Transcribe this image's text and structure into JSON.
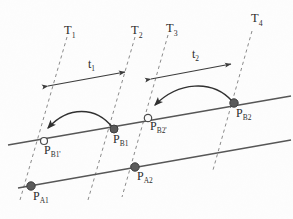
{
  "figure": {
    "background_color": "#fdfdfd",
    "ink_color": "#3a3a3a",
    "solid_line_color": "#555555",
    "dashed_line_color": "#8a8a8a",
    "filled_marker_color": "#555555",
    "open_marker_fill": "#ffffff"
  },
  "time_lines": [
    {
      "id": "T1",
      "label": "T",
      "subscript": "1"
    },
    {
      "id": "T2",
      "label": "T",
      "subscript": "2"
    },
    {
      "id": "T3",
      "label": "T",
      "subscript": "3"
    },
    {
      "id": "T4",
      "label": "T",
      "subscript": "4"
    }
  ],
  "intervals": [
    {
      "id": "t1",
      "label": "t",
      "subscript": "1",
      "from": "T1",
      "to": "T2"
    },
    {
      "id": "t2",
      "label": "t",
      "subscript": "2",
      "from": "T3",
      "to": "T4"
    }
  ],
  "points": [
    {
      "id": "PB1p",
      "label": "P",
      "subscript": "B1'",
      "marker": "open",
      "line": "upper"
    },
    {
      "id": "PB1",
      "label": "P",
      "subscript": "B1",
      "marker": "filled",
      "line": "upper"
    },
    {
      "id": "PB2p",
      "label": "P",
      "subscript": "B2'",
      "marker": "open",
      "line": "upper"
    },
    {
      "id": "PB2",
      "label": "P",
      "subscript": "B2",
      "marker": "filled",
      "line": "upper"
    },
    {
      "id": "PA1",
      "label": "P",
      "subscript": "A1",
      "marker": "filled",
      "line": "lower"
    },
    {
      "id": "PA2",
      "label": "P",
      "subscript": "A2",
      "marker": "filled",
      "line": "lower"
    }
  ],
  "migrations": [
    {
      "id": "arrow-b1",
      "from": "PB1",
      "to": "PB1p"
    },
    {
      "id": "arrow-b2",
      "from": "PB2",
      "to": "PB2p"
    }
  ]
}
